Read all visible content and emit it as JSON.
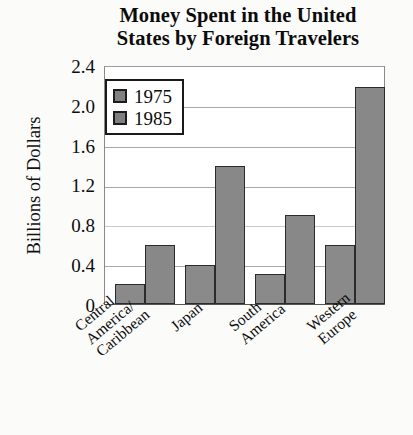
{
  "chart_data": {
    "type": "bar",
    "title": "Money Spent in the United States by Foreign Travelers",
    "title_lines": [
      "Money Spent in the United",
      "States by Foreign Travelers"
    ],
    "xlabel": "",
    "ylabel": "Billions of Dollars",
    "ylim": [
      0,
      2.4
    ],
    "ytick_labels": [
      "2.4",
      "2.0",
      "1.6",
      "1.2",
      "0.8",
      "0.4",
      "0"
    ],
    "ytick_values": [
      2.4,
      2.0,
      1.6,
      1.2,
      0.8,
      0.4,
      0
    ],
    "grid": true,
    "legend_position": "upper-left-inside",
    "categories": [
      "Central America/Caribbean",
      "Japan",
      "South America",
      "Western Europe"
    ],
    "category_lines": [
      [
        "Central",
        "America/",
        "Caribbean"
      ],
      [
        "Japan"
      ],
      [
        "South",
        "America"
      ],
      [
        "Western",
        "Europe"
      ]
    ],
    "series": [
      {
        "name": "1975",
        "color": "#8a8a8a",
        "values": [
          0.2,
          0.4,
          0.3,
          0.6
        ]
      },
      {
        "name": "1985",
        "color": "#888888",
        "values": [
          0.6,
          1.4,
          0.9,
          2.2
        ]
      }
    ]
  },
  "legend": {
    "items": [
      {
        "label": "1975",
        "swatch": "#808080"
      },
      {
        "label": "1985",
        "swatch": "#808080"
      }
    ]
  },
  "colors": {
    "bar_fill": "#8a8a8a",
    "bar_stroke": "#2b2b2b",
    "gridline": "#a9a9a9",
    "axis": "#555555",
    "text": "#0d0d0d",
    "background": "#fbfbfa"
  }
}
